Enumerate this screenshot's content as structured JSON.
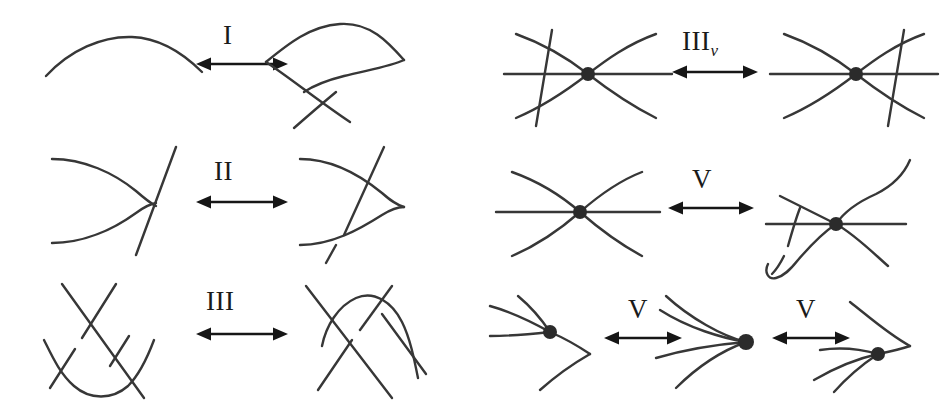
{
  "figure": {
    "background_color": "#ffffff",
    "stroke_color": "#373737",
    "label_color": "#1a1a1a",
    "vertex_color": "#2b2b2b",
    "width": 952,
    "height": 411
  },
  "labels": {
    "move_1": "I",
    "move_2": "II",
    "move_3": "III",
    "move_3v_base": "III",
    "move_3v_sub": "v",
    "move_v_a": "V",
    "move_v_b": "V",
    "move_v_c": "V"
  },
  "rows": [
    {
      "id": "row-1-left",
      "label": "I",
      "left_panel": "single-arc-strand",
      "right_panel": "arc-with-kink-crossing",
      "arrow": "double-headed-arrow"
    },
    {
      "id": "row-2-left",
      "label": "II",
      "left_panel": "cusp-pair-with-separate-line",
      "right_panel": "cusp-pair-crossed-by-line",
      "arrow": "double-headed-arrow"
    },
    {
      "id": "row-3-left",
      "label": "III",
      "left_panel": "three-strand-crossing-bottom-arc",
      "right_panel": "three-strand-crossing-top-arc",
      "arrow": "double-headed-arrow"
    },
    {
      "id": "row-1-right",
      "label": "III_v",
      "left_panel": "virtual-vertex-line-left",
      "right_panel": "virtual-vertex-line-right",
      "arrow": "double-headed-arrow"
    },
    {
      "id": "row-2-right",
      "label": "V",
      "left_panel": "virtual-vertex-four-strands",
      "right_panel": "virtual-vertex-detour-strand",
      "arrow": "double-headed-arrow"
    },
    {
      "id": "row-3-right",
      "label_a": "V",
      "label_b": "V",
      "panel_a": "vertex-cusp-left",
      "panel_b": "vertex-fan-center",
      "panel_c": "vertex-cusp-right",
      "arrows": [
        "double-headed-arrow",
        "double-headed-arrow"
      ]
    }
  ],
  "counts": {
    "panels": 13,
    "arrows": 7,
    "vertices": 8
  }
}
